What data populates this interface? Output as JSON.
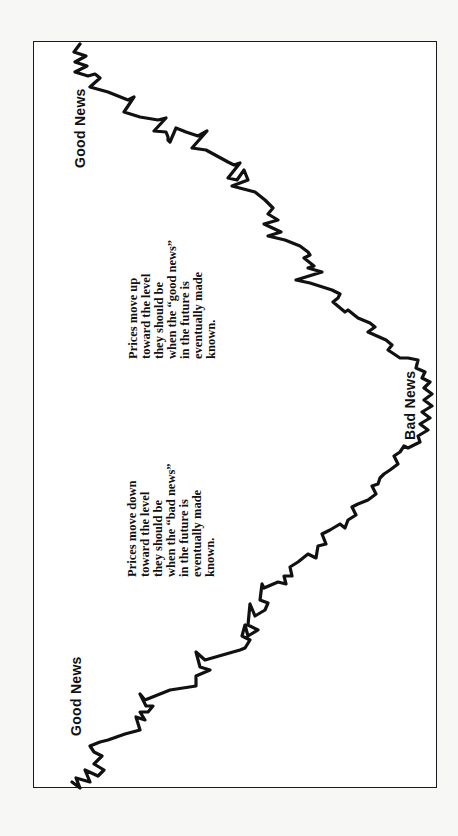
{
  "diagram": {
    "type": "price-path-diagram",
    "orientation": "rotated-90-ccw",
    "labels": {
      "start": "Good News",
      "middle": "Bad News",
      "end": "Good News"
    },
    "notes": {
      "down": {
        "lines": [
          "Prices move down",
          "toward the level",
          "they should be",
          "when the “bad news”",
          "in the future is",
          "eventually made",
          "known."
        ]
      },
      "up": {
        "lines": [
          "Prices move up",
          "toward the level",
          "they should be",
          "when the “good news”",
          "in the future is",
          "eventually made",
          "known."
        ]
      }
    },
    "colors": {
      "line": "#111111",
      "frame": "#1a1a1a",
      "background": "#ffffff"
    }
  }
}
